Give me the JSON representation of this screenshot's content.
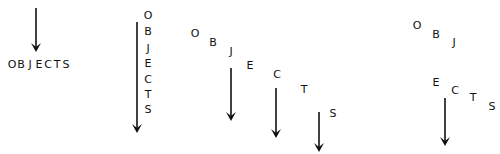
{
  "diagram": {
    "word": "OBJECTS",
    "colors": {
      "ink": "#111111",
      "background": "#ffffff"
    },
    "panels": [
      {
        "name": "horizontal-word-below-arrow",
        "arrows": [
          {
            "x": 36,
            "y1": 8,
            "y2": 52
          }
        ],
        "letters": [
          {
            "ch": "O",
            "x": 12,
            "y": 68
          },
          {
            "ch": "B",
            "x": 21,
            "y": 68
          },
          {
            "ch": "J",
            "x": 30,
            "y": 68
          },
          {
            "ch": "E",
            "x": 39,
            "y": 68
          },
          {
            "ch": "C",
            "x": 48,
            "y": 68
          },
          {
            "ch": "T",
            "x": 57,
            "y": 68
          },
          {
            "ch": "S",
            "x": 66,
            "y": 68
          }
        ]
      },
      {
        "name": "vertical-word-beside-arrow",
        "arrows": [
          {
            "x": 137,
            "y1": 22,
            "y2": 133
          }
        ],
        "letters": [
          {
            "ch": "O",
            "x": 148,
            "y": 19
          },
          {
            "ch": "B",
            "x": 148,
            "y": 35
          },
          {
            "ch": "J",
            "x": 148,
            "y": 52
          },
          {
            "ch": "E",
            "x": 148,
            "y": 67
          },
          {
            "ch": "C",
            "x": 148,
            "y": 83
          },
          {
            "ch": "T",
            "x": 148,
            "y": 98
          },
          {
            "ch": "S",
            "x": 148,
            "y": 113
          }
        ]
      },
      {
        "name": "diagonal-word-with-three-arrows",
        "arrows": [
          {
            "x": 231,
            "y1": 68,
            "y2": 121
          },
          {
            "x": 276,
            "y1": 88,
            "y2": 138
          },
          {
            "x": 319,
            "y1": 112,
            "y2": 152
          }
        ],
        "letters": [
          {
            "ch": "O",
            "x": 195,
            "y": 37
          },
          {
            "ch": "B",
            "x": 213,
            "y": 46
          },
          {
            "ch": "J",
            "x": 231,
            "y": 55
          },
          {
            "ch": "E",
            "x": 250,
            "y": 69
          },
          {
            "ch": "C",
            "x": 277,
            "y": 78
          },
          {
            "ch": "T",
            "x": 304,
            "y": 93
          },
          {
            "ch": "S",
            "x": 333,
            "y": 117
          }
        ]
      },
      {
        "name": "split-word-with-one-arrow",
        "arrows": [
          {
            "x": 445,
            "y1": 98,
            "y2": 146
          }
        ],
        "letters": [
          {
            "ch": "O",
            "x": 417,
            "y": 29
          },
          {
            "ch": "B",
            "x": 436,
            "y": 38
          },
          {
            "ch": "J",
            "x": 454,
            "y": 46
          },
          {
            "ch": "E",
            "x": 436,
            "y": 86
          },
          {
            "ch": "C",
            "x": 455,
            "y": 94
          },
          {
            "ch": "T",
            "x": 473,
            "y": 101
          },
          {
            "ch": "S",
            "x": 492,
            "y": 110
          }
        ]
      }
    ]
  }
}
